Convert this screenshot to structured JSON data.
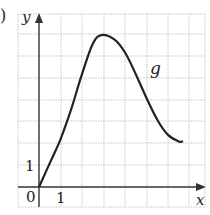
{
  "panel": {
    "label": ")"
  },
  "chart_data": {
    "type": "line",
    "title": "",
    "xlabel": "x",
    "ylabel": "y",
    "series": [
      {
        "name": "g",
        "x": [
          0,
          0.5,
          1,
          1.5,
          2,
          2.5,
          2.9,
          3.5,
          4,
          4.5,
          5,
          5.5,
          6,
          6.5,
          6.7
        ],
        "y": [
          0,
          1.1,
          2.2,
          3.6,
          5.2,
          6.6,
          7.0,
          6.8,
          6.2,
          5.2,
          4.1,
          3.1,
          2.4,
          2.1,
          2.1
        ]
      }
    ],
    "curve_label": "g",
    "tick_labels": {
      "origin": "0",
      "x": "1",
      "y": "1"
    },
    "xlim": [
      -1,
      7.7
    ],
    "ylim": [
      -1,
      8
    ],
    "grid": true,
    "grid_spacing": 1
  }
}
